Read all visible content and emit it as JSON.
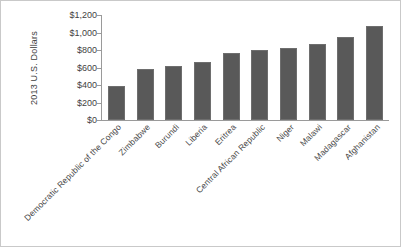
{
  "chart_data": {
    "type": "bar",
    "title": "",
    "subtitle": "",
    "xlabel": "",
    "ylabel": "2013 U.S. Dollars",
    "ylim": [
      0,
      1200
    ],
    "ytick_step": 200,
    "ytick_labels": [
      "$1,200",
      "$1,000",
      "$800",
      "$600",
      "$400",
      "$200",
      "$0"
    ],
    "ytick_values": [
      1200,
      1000,
      800,
      600,
      400,
      200,
      0
    ],
    "grid": false,
    "legend": null,
    "bar_color": "#595959",
    "axis_color": "#9a9a9a",
    "categories": [
      "Democratic Republic of the Congo",
      "Zimbabwe",
      "Burundi",
      "Liberia",
      "Eritrea",
      "Central African Republic",
      "Niger",
      "Malawi",
      "Madagascar",
      "Afghanistan"
    ],
    "values": [
      390,
      580,
      615,
      660,
      765,
      800,
      825,
      870,
      950,
      1080
    ]
  }
}
